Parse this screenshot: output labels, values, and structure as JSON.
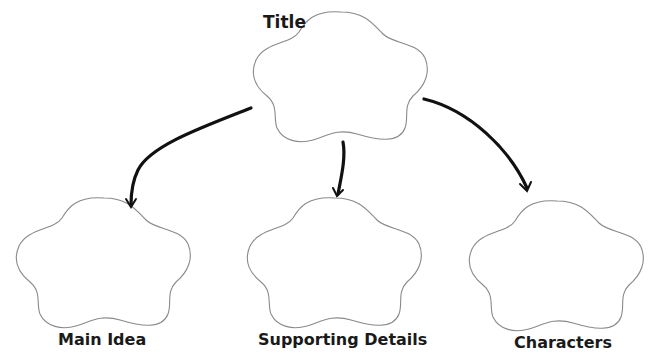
{
  "diagram": {
    "type": "graphic-organizer",
    "root": {
      "id": "title",
      "label": "Title"
    },
    "children": [
      {
        "id": "main-idea",
        "label": "Main Idea"
      },
      {
        "id": "supporting-details",
        "label": "Supporting Details"
      },
      {
        "id": "characters",
        "label": "Characters"
      }
    ],
    "edges": [
      {
        "from": "title",
        "to": "main-idea"
      },
      {
        "from": "title",
        "to": "supporting-details"
      },
      {
        "from": "title",
        "to": "characters"
      }
    ],
    "colors": {
      "outline": "#8a8a8a",
      "arrow": "#111111",
      "text": "#1a1a1a",
      "background": "#ffffff"
    }
  }
}
